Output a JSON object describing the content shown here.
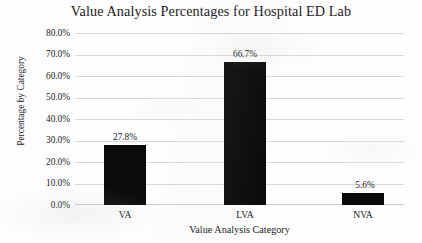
{
  "chart_data": {
    "type": "bar",
    "title": "Value Analysis Percentages for Hospital ED Lab",
    "xlabel": "Value Analysis Category",
    "ylabel": "Percentage by Category",
    "categories": [
      "VA",
      "LVA",
      "NVA"
    ],
    "values": [
      27.8,
      66.7,
      5.6
    ],
    "data_labels": [
      "27.8%",
      "66.7%",
      "5.6%"
    ],
    "ylim": [
      0,
      80
    ],
    "ytick_values": [
      0,
      10,
      20,
      30,
      40,
      50,
      60,
      70,
      80
    ],
    "ytick_labels": [
      "0.0%",
      "10.0%",
      "20.0%",
      "30.0%",
      "40.0%",
      "50.0%",
      "60.0%",
      "70.0%",
      "80.0%"
    ],
    "grid": "horizontal",
    "legend": "none",
    "bar_color": "#0b0b0b",
    "gridline_color": "#d9d9d9",
    "background_color": "#fdfdfd"
  }
}
